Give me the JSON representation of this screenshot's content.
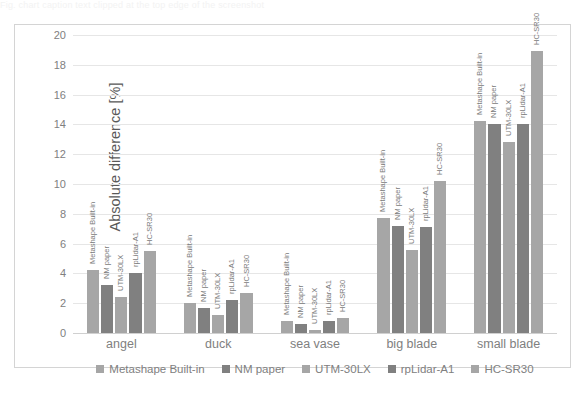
{
  "top_caption_sliver": "Fig. chart caption text clipped at the top edge of the screenshot",
  "chart_data": {
    "type": "bar",
    "title": "",
    "subtitle": "",
    "xlabel": "",
    "ylabel": "Absolute difference [%]",
    "ylim": [
      0,
      20
    ],
    "ytick_step": 2,
    "yticks": [
      "20",
      "18",
      "16",
      "14",
      "12",
      "10",
      "8",
      "6",
      "4",
      "2",
      "0"
    ],
    "grid": true,
    "legend_position": "bottom",
    "categories": [
      "angel",
      "duck",
      "sea vase",
      "big blade",
      "small blade"
    ],
    "series": [
      {
        "name": "Metashape Built-in",
        "legend_label": "Metashape Built-in",
        "bar_label": "Metashape Built-in",
        "color": "#a6a6a6",
        "values": [
          4.2,
          2.0,
          0.8,
          7.7,
          14.2
        ]
      },
      {
        "name": "NM paper",
        "legend_label": "NM paper",
        "bar_label": "NM paper",
        "color": "#808080",
        "values": [
          3.2,
          1.7,
          0.6,
          7.2,
          14.0
        ]
      },
      {
        "name": "UTM-30LX",
        "legend_label": "UTM-30LX",
        "bar_label": "UTM-30LX",
        "color": "#a6a6a6",
        "values": [
          2.4,
          1.2,
          0.2,
          5.6,
          12.8
        ]
      },
      {
        "name": "rpLidar-A1",
        "legend_label": "rpLidar-A1",
        "bar_label": "rpLidar-A1",
        "color": "#808080",
        "values": [
          4.0,
          2.2,
          0.8,
          7.1,
          14.0
        ]
      },
      {
        "name": "HC-SR30",
        "legend_label": "HC-SR30",
        "bar_label": "HC-SR30",
        "color": "#a6a6a6",
        "values": [
          5.5,
          2.7,
          1.0,
          10.2,
          18.9
        ]
      }
    ]
  },
  "colors": {
    "series_light": "#a6a6a6",
    "series_dark": "#808080",
    "gridline": "#e6e6e6",
    "axis_text": "#808080",
    "axis_title": "#595959",
    "frame": "#d4d4d4",
    "background": "#ffffff"
  }
}
